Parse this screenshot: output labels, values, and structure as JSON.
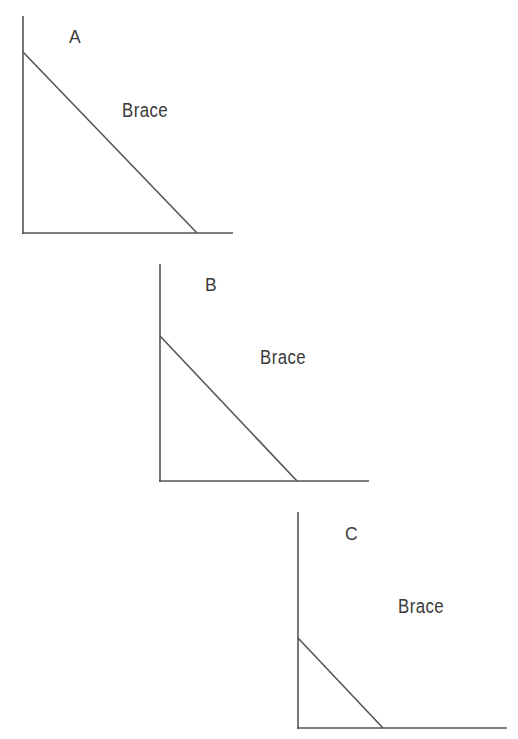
{
  "diagram": {
    "title": "",
    "background": "#ffffff",
    "line_color": "#555555",
    "text_color": "#3a3a3a",
    "panels": [
      {
        "id": "A",
        "letter": "A",
        "brace_label": "Brace",
        "vertical": {
          "x1": 23,
          "y1": 16,
          "x2": 23,
          "y2": 234
        },
        "horizontal": {
          "x1": 22,
          "y1": 233,
          "x2": 233,
          "y2": 233
        },
        "brace": {
          "x1": 23,
          "y1": 52,
          "x2": 197,
          "y2": 233
        },
        "letter_pos": {
          "x": 69,
          "y": 27
        },
        "brace_label_pos": {
          "x": 122,
          "y": 100
        }
      },
      {
        "id": "B",
        "letter": "B",
        "brace_label": "Brace",
        "vertical": {
          "x1": 160,
          "y1": 264,
          "x2": 160,
          "y2": 482
        },
        "horizontal": {
          "x1": 159,
          "y1": 481,
          "x2": 369,
          "y2": 481
        },
        "brace": {
          "x1": 160,
          "y1": 336,
          "x2": 297,
          "y2": 481
        },
        "letter_pos": {
          "x": 205,
          "y": 275
        },
        "brace_label_pos": {
          "x": 260,
          "y": 347
        }
      },
      {
        "id": "C",
        "letter": "C",
        "brace_label": "Brace",
        "vertical": {
          "x1": 298,
          "y1": 512,
          "x2": 298,
          "y2": 729
        },
        "horizontal": {
          "x1": 297,
          "y1": 728,
          "x2": 507,
          "y2": 728
        },
        "brace": {
          "x1": 298,
          "y1": 638,
          "x2": 383,
          "y2": 728
        },
        "letter_pos": {
          "x": 345,
          "y": 524
        },
        "brace_label_pos": {
          "x": 398,
          "y": 596
        }
      }
    ]
  }
}
